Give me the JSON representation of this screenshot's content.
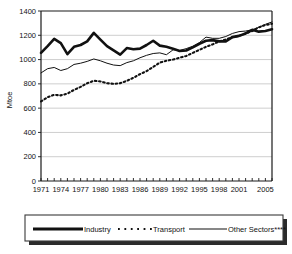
{
  "chart_data": {
    "type": "line",
    "title": "",
    "xlabel": "",
    "ylabel": "Mtoe",
    "ylim": [
      0,
      1400
    ],
    "xlim": [
      1971,
      2006
    ],
    "grid": true,
    "legend_position": "bottom",
    "y_ticks": [
      "0",
      "200",
      "400",
      "600",
      "800",
      "1000",
      "1200",
      "1400"
    ],
    "y_tick_values": [
      0,
      200,
      400,
      600,
      800,
      1000,
      1200,
      1400
    ],
    "x_tick_labels": [
      "1971",
      "1974",
      "1977",
      "1980",
      "1983",
      "1986",
      "1989",
      "1992",
      "1995",
      "1998",
      "2001",
      "2005"
    ],
    "x_tick_values": [
      1971,
      1974,
      1977,
      1980,
      1983,
      1986,
      1989,
      1992,
      1995,
      1998,
      2001,
      2005
    ],
    "x": [
      1971,
      1972,
      1973,
      1974,
      1975,
      1976,
      1977,
      1978,
      1979,
      1980,
      1981,
      1982,
      1983,
      1984,
      1985,
      1986,
      1987,
      1988,
      1989,
      1990,
      1991,
      1992,
      1993,
      1994,
      1995,
      1996,
      1997,
      1998,
      1999,
      2000,
      2001,
      2002,
      2003,
      2004,
      2005,
      2006
    ],
    "series": [
      {
        "name": "Industry",
        "style": "thick-solid",
        "values": [
          1055,
          1110,
          1170,
          1135,
          1045,
          1105,
          1120,
          1150,
          1220,
          1165,
          1110,
          1075,
          1040,
          1095,
          1085,
          1090,
          1120,
          1155,
          1115,
          1105,
          1090,
          1070,
          1075,
          1100,
          1130,
          1155,
          1160,
          1150,
          1150,
          1185,
          1195,
          1215,
          1245,
          1230,
          1235,
          1250
        ]
      },
      {
        "name": "Transport",
        "style": "dotted",
        "values": [
          655,
          690,
          710,
          705,
          720,
          750,
          775,
          805,
          825,
          820,
          805,
          800,
          805,
          825,
          850,
          880,
          905,
          940,
          975,
          990,
          1000,
          1015,
          1030,
          1055,
          1080,
          1105,
          1125,
          1150,
          1165,
          1185,
          1195,
          1215,
          1235,
          1265,
          1285,
          1295
        ]
      },
      {
        "name": "Other Sectors****",
        "style": "thin-solid",
        "values": [
          890,
          925,
          935,
          910,
          925,
          960,
          970,
          985,
          1005,
          990,
          970,
          955,
          950,
          975,
          990,
          1015,
          1035,
          1050,
          1055,
          1040,
          1080,
          1075,
          1090,
          1110,
          1140,
          1185,
          1175,
          1175,
          1190,
          1215,
          1230,
          1235,
          1245,
          1265,
          1290,
          1310
        ]
      }
    ]
  },
  "legend": {
    "items": [
      {
        "label": "Industry",
        "marker": "thick-solid-line-swatch"
      },
      {
        "label": "Transport",
        "marker": "dotted-line-swatch"
      },
      {
        "label": "Other Sectors****",
        "marker": "thin-solid-line-swatch"
      }
    ]
  }
}
